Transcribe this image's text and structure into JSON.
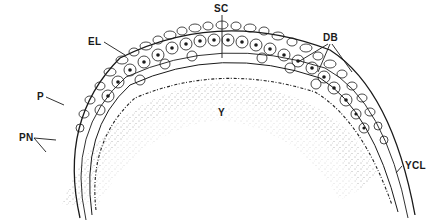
{
  "figure": {
    "type": "histological section drawing (blastoderm over yolk)",
    "ink_color": "#1a1a1a",
    "background": "#ffffff",
    "labels": [
      {
        "id": "SC",
        "text": "SC",
        "x": 216,
        "y": 4
      },
      {
        "id": "EL",
        "text": "EL",
        "x": 88,
        "y": 38
      },
      {
        "id": "DB",
        "text": "DB",
        "x": 324,
        "y": 33
      },
      {
        "id": "P",
        "text": "P",
        "x": 37,
        "y": 94
      },
      {
        "id": "Y",
        "text": "Y",
        "x": 218,
        "y": 108
      },
      {
        "id": "PN",
        "text": "PN",
        "x": 19,
        "y": 134
      },
      {
        "id": "YCL",
        "text": "YCL",
        "x": 405,
        "y": 161
      }
    ]
  }
}
